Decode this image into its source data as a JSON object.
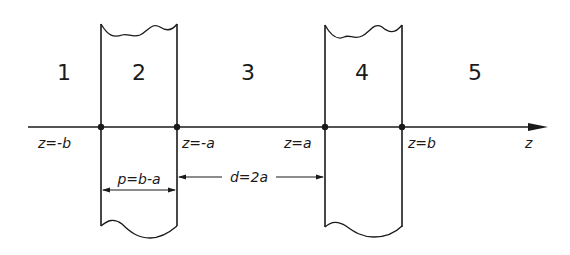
{
  "diagram": {
    "axis": {
      "label": "z",
      "direction": "right"
    },
    "regions": [
      {
        "id": "1",
        "label": "1",
        "x": 64
      },
      {
        "id": "2",
        "label": "2",
        "x": 139
      },
      {
        "id": "3",
        "label": "3",
        "x": 248
      },
      {
        "id": "4",
        "label": "4",
        "x": 362
      },
      {
        "id": "5",
        "label": "5",
        "x": 475
      }
    ],
    "boundaries": [
      {
        "label": "z=-b",
        "x": 101
      },
      {
        "label": "z=-a",
        "x": 177
      },
      {
        "label": "z=a",
        "x": 325
      },
      {
        "label": "z=b",
        "x": 402
      }
    ],
    "dimensions": {
      "slab_thickness": "p=b-a",
      "gap_width": "d=2a"
    },
    "colors": {
      "stroke": "#1a1a1a",
      "background": "#ffffff"
    }
  }
}
